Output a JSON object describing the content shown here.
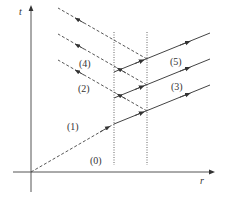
{
  "diagram": {
    "axes": {
      "x_label": "r",
      "y_label": "t"
    },
    "regions": [
      {
        "id": "0",
        "label": "(0)"
      },
      {
        "id": "1",
        "label": "(1)"
      },
      {
        "id": "2",
        "label": "(2)"
      },
      {
        "id": "3",
        "label": "(3)"
      },
      {
        "id": "4",
        "label": "(4)"
      },
      {
        "id": "5",
        "label": "(5)"
      }
    ],
    "colors": {
      "line": "#444444",
      "axis": "#555555"
    }
  }
}
